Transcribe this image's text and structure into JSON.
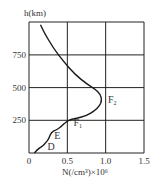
{
  "chart_data": {
    "type": "line",
    "title": "",
    "ylabel": "h(km)",
    "xlabel": "N(/cm³)×10⁶",
    "xlim": [
      0,
      1.5
    ],
    "ylim": [
      0,
      1000
    ],
    "x_ticks": [
      "0",
      "0.5",
      "1.0",
      "1.5"
    ],
    "y_ticks": [
      "250",
      "500",
      "750"
    ],
    "grid": true,
    "series": [
      {
        "name": "electron density profile",
        "points": [
          [
            0.07,
            0
          ],
          [
            0.1,
            20
          ],
          [
            0.14,
            40
          ],
          [
            0.18,
            55
          ],
          [
            0.22,
            80
          ],
          [
            0.26,
            110
          ],
          [
            0.29,
            160
          ],
          [
            0.35,
            175
          ],
          [
            0.42,
            200
          ],
          [
            0.5,
            250
          ],
          [
            0.62,
            265
          ],
          [
            0.75,
            285
          ],
          [
            0.85,
            320
          ],
          [
            0.92,
            360
          ],
          [
            0.95,
            400
          ],
          [
            0.93,
            450
          ],
          [
            0.86,
            490
          ],
          [
            0.75,
            530
          ],
          [
            0.6,
            600
          ],
          [
            0.45,
            700
          ],
          [
            0.32,
            800
          ],
          [
            0.2,
            920
          ],
          [
            0.15,
            980
          ]
        ]
      }
    ],
    "annotations": [
      {
        "text": "D",
        "x": 0.24,
        "y": 25
      },
      {
        "text": "E",
        "x": 0.33,
        "y": 110
      },
      {
        "text": "F",
        "sub": "1",
        "x": 0.58,
        "y": 205
      },
      {
        "text": "F",
        "sub": "2",
        "x": 1.03,
        "y": 385
      }
    ]
  }
}
